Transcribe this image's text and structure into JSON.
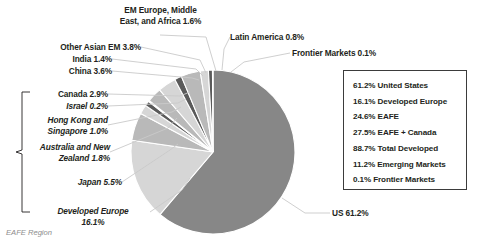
{
  "chart_data": {
    "type": "pie",
    "title": "",
    "categories": [
      "US",
      "Developed Europe",
      "Japan",
      "Australia and New Zealand",
      "Hong Kong and Singapore",
      "Israel",
      "Canada",
      "China",
      "India",
      "Other Asian EM",
      "EM Europe, Middle East, and Africa",
      "Latin America",
      "Frontier Markets"
    ],
    "values": [
      61.2,
      16.1,
      5.5,
      1.8,
      1.0,
      0.2,
      2.9,
      3.6,
      1.4,
      3.8,
      1.6,
      0.8,
      0.1
    ],
    "unit": "%",
    "legend_position": "right-box",
    "grid": false
  },
  "slice_labels": {
    "us": "US 61.2%",
    "developed_europe_l1": "Developed Europe",
    "developed_europe_l2": "16.1%",
    "japan": "Japan 5.5%",
    "anz_l1": "Australia and New",
    "anz_l2": "Zealand 1.8%",
    "hk_sg_l1": "Hong Kong and",
    "hk_sg_l2": "Singapore 1.0%",
    "israel": "Israel 0.2%",
    "canada": "Canada 2.9%",
    "china": "China 3.6%",
    "india": "India 1.4%",
    "other_asian_em": "Other Asian EM 3.8%",
    "emea_l1": "EM Europe, Middle",
    "emea_l2": "East, and Africa 1.6%",
    "latin_america": "Latin America 0.8%",
    "frontier_markets": "Frontier Markets 0.1%"
  },
  "bracket_caption": "EAFE Region",
  "legend": {
    "rows": [
      "61.2% United States",
      "16.1% Developed Europe",
      "24.6% EAFE",
      "27.5% EAFE + Canada",
      "88.7% Total Developed",
      "11.2% Emerging Markets",
      "0.1% Frontier Markets"
    ]
  },
  "colors": {
    "background": "#ffffff",
    "text": "#231f20",
    "caption": "#8d8d8d",
    "legend_border": "#3b3b3b",
    "slice_us": "#878787",
    "slice_mid": "#b9b9b9",
    "slice_light": "#d6d6d6",
    "slice_dark": "#5a5a5a",
    "leader_line": "#c9c9c9"
  }
}
